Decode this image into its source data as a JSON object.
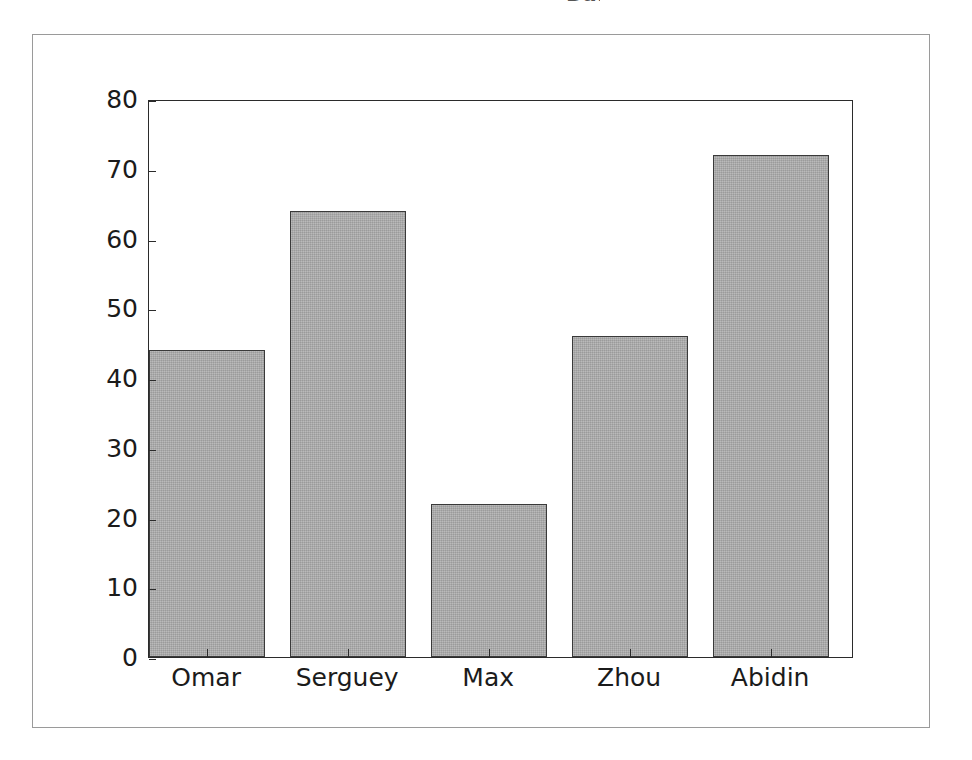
{
  "figure": {
    "title_remnant": "Bar graph",
    "background_color": "#ffffff",
    "frame_color": "#9a9a9a"
  },
  "chart_data": {
    "type": "bar",
    "title": "",
    "xlabel": "",
    "ylabel": "",
    "categories": [
      "Omar",
      "Serguey",
      "Max",
      "Zhou",
      "Abidin"
    ],
    "values": [
      44,
      64,
      22,
      46,
      72
    ],
    "ylim": [
      0,
      80
    ],
    "yticks": [
      0,
      10,
      20,
      30,
      40,
      50,
      60,
      70,
      80
    ],
    "ytick_labels": [
      "0",
      "10",
      "20",
      "30",
      "40",
      "50",
      "60",
      "70",
      "80"
    ],
    "grid": false,
    "legend": false,
    "bar_fill_color": "#a9a9a9",
    "bar_edge_color": "#3a3a3a",
    "axis_color": "#2b2b2b"
  }
}
